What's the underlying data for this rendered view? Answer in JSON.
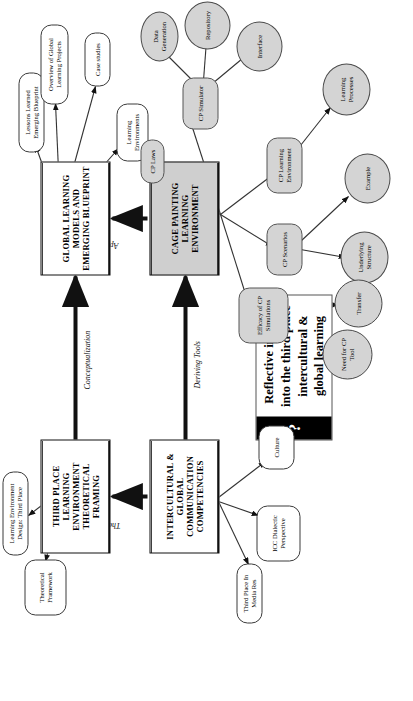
{
  "diagram": {
    "title": "Reflective inquiry into the third place intercultural & global learning",
    "orientation": "rotated-90-ccw",
    "colors": {
      "shaded_box": "#cfcfcf",
      "ellipse_fill": "#d4d4d4",
      "stroke": "#111111",
      "question_band": "#000000"
    }
  },
  "center_card": {
    "question_glyph": "?",
    "text": "Reflective inquiry into the third place intercultural & global learning"
  },
  "process_boxes": [
    {
      "id": "icc",
      "label": "INTERCULTURAL & GLOBAL COMMUNICATION COMPETENCIES",
      "shaded": false
    },
    {
      "id": "tple",
      "label": "THIRD PLACE LEARNING ENVIRONMENT THEORETICAL FRAMING",
      "shaded": false
    },
    {
      "id": "glm",
      "label": "GLOBAL LEARNING MODELS AND EMERGING BLUEPRINT",
      "shaded": false
    },
    {
      "id": "cple",
      "label": "CAGE PAINTING LEARNING ENVIRONMENT",
      "shaded": true
    }
  ],
  "edge_labels": [
    {
      "id": "theoretical-framing",
      "text": "Theoretical Framing"
    },
    {
      "id": "conceptualization",
      "text": "Conceptualization"
    },
    {
      "id": "deriving-tools",
      "text": "Deriving Tools"
    },
    {
      "id": "applications",
      "text": "Applications"
    }
  ],
  "satellites": {
    "icc_nodes": [
      {
        "id": "third-place-in-media-res",
        "label": "Third Place In Media Res"
      },
      {
        "id": "icc-dialectic-perspective",
        "label": "ICC Dialectic Perspective"
      },
      {
        "id": "culture",
        "label": "Culture"
      }
    ],
    "tple_nodes": [
      {
        "id": "theoretical-framework",
        "label": "Theoretical Framework"
      },
      {
        "id": "learning-environment-design-third-place",
        "label": "Learning Environment Design: Third Place"
      }
    ],
    "glm_nodes": [
      {
        "id": "lessons-learned-emerging-blueprint",
        "label": "Lessons Learned Emerging Blueprint"
      },
      {
        "id": "overview-of-global-learning-projects",
        "label": "Overview of Global Learning Projects"
      },
      {
        "id": "case-studies",
        "label": "Case studies"
      },
      {
        "id": "learning-environments",
        "label": "Learning Environments"
      }
    ],
    "cple_nodes": [
      {
        "id": "cp-laws",
        "label": "CP Laws"
      },
      {
        "id": "cp-simulator",
        "label": "CP Simulator"
      },
      {
        "id": "cp-learning-environment",
        "label": "CP Learning Environment"
      },
      {
        "id": "cp-scenarios",
        "label": "CP Scenarios"
      },
      {
        "id": "efficacy-of-cp-simulations",
        "label": "Efficacy of CP Simulations"
      }
    ],
    "cp_simulator_children": [
      {
        "id": "data-generation",
        "label": "Data Generation"
      },
      {
        "id": "repository",
        "label": "Repository"
      },
      {
        "id": "interface",
        "label": "Interface"
      }
    ],
    "cp_learning_environment_children": [
      {
        "id": "learning-processes",
        "label": "Learning Processes"
      }
    ],
    "cp_scenarios_children": [
      {
        "id": "underlying-structure",
        "label": "Underlying Structure"
      },
      {
        "id": "example",
        "label": "Example"
      }
    ],
    "efficacy_children": [
      {
        "id": "need-for-cp-tool",
        "label": "Need for CP Tool"
      },
      {
        "id": "transfer",
        "label": "Transfer"
      }
    ]
  }
}
